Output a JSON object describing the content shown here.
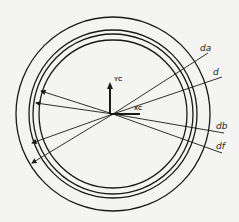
{
  "diagram": {
    "type": "gear-circles",
    "center": {
      "x": 113,
      "y": 114
    },
    "circles": [
      {
        "name": "addendum",
        "label": "da",
        "r": 97
      },
      {
        "name": "pitch",
        "label": "d",
        "r": 84
      },
      {
        "name": "base",
        "label": "db",
        "r": 80
      },
      {
        "name": "root",
        "label": "df",
        "r": 74
      }
    ],
    "axes": {
      "x_label": "XC",
      "y_label": "YC"
    },
    "labels": {
      "da": "da",
      "d": "d",
      "db": "db",
      "df": "df"
    },
    "colors": {
      "line": "#1a1a1a",
      "background": "#f4f4f2"
    }
  }
}
